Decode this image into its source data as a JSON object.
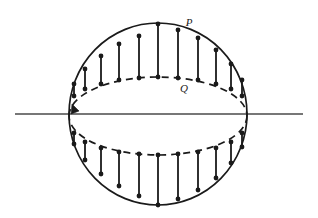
{
  "figure": {
    "type": "geometric-diagram",
    "background_color": "#ffffff",
    "ink_color": "#1a1a1a",
    "canvas": {
      "width": 318,
      "height": 218
    },
    "top_artifact_text": "",
    "labels": [
      {
        "name": "point-p-label",
        "text": "P",
        "x": 189,
        "y": 26
      },
      {
        "name": "point-q-label",
        "text": "Q",
        "x": 184,
        "y": 92
      }
    ],
    "axis_line": {
      "name": "horizontal-axis",
      "x1": 15,
      "y1": 114,
      "x2": 303,
      "y2": 114,
      "stroke_width": 1.6,
      "color": "#4a4a4a"
    },
    "circle": {
      "name": "sphere-outline",
      "cx": 158,
      "cy": 114,
      "rx": 89,
      "ry": 91,
      "stroke_width": 1.7
    },
    "ellipse": {
      "name": "equator-ellipse",
      "cx": 158,
      "cy": 116,
      "rx": 89,
      "ry": 39,
      "stroke_width": 1.7,
      "dash_pattern": "7 5",
      "front_is_dashed": false,
      "back_is_dashed": true,
      "direction_arrow": {
        "name": "direction-arrow",
        "at_x": 72,
        "at_y": 104,
        "angle_deg": 250
      }
    },
    "chords": {
      "name": "pq-chord-set",
      "stroke_width": 1.8,
      "dot_radius": 2.4,
      "upper_count": 11,
      "lower_count": 11,
      "angles_deg": [
        14,
        32,
        50,
        68,
        86,
        104,
        122,
        140,
        158,
        176,
        194
      ]
    },
    "chart_data": {
      "type": "scatter",
      "title": "",
      "xlabel": "",
      "ylabel": "",
      "note": "Each vertical segment joins a point P on the sphere profile circle to the corresponding point Q on the equatorial ellipse directly below (or above) it.",
      "upper_segments": [
        {
          "x": 74,
          "p_y": 84,
          "q_y": 96
        },
        {
          "x": 85,
          "p_y": 69,
          "q_y": 89
        },
        {
          "x": 101,
          "p_y": 56,
          "q_y": 84
        },
        {
          "x": 119,
          "p_y": 44,
          "q_y": 80
        },
        {
          "x": 139,
          "p_y": 36,
          "q_y": 78
        },
        {
          "x": 158,
          "p_y": 24,
          "q_y": 77
        },
        {
          "x": 178,
          "p_y": 30,
          "q_y": 78
        },
        {
          "x": 198,
          "p_y": 38,
          "q_y": 80
        },
        {
          "x": 216,
          "p_y": 50,
          "q_y": 84
        },
        {
          "x": 231,
          "p_y": 64,
          "q_y": 89
        },
        {
          "x": 242,
          "p_y": 80,
          "q_y": 96
        }
      ],
      "lower_segments": [
        {
          "x": 74,
          "p_y": 144,
          "q_y": 133
        },
        {
          "x": 85,
          "p_y": 160,
          "q_y": 142
        },
        {
          "x": 101,
          "p_y": 174,
          "q_y": 148
        },
        {
          "x": 119,
          "p_y": 186,
          "q_y": 152
        },
        {
          "x": 139,
          "p_y": 196,
          "q_y": 154
        },
        {
          "x": 158,
          "p_y": 205,
          "q_y": 155
        },
        {
          "x": 178,
          "p_y": 199,
          "q_y": 154
        },
        {
          "x": 198,
          "p_y": 190,
          "q_y": 152
        },
        {
          "x": 216,
          "p_y": 178,
          "q_y": 148
        },
        {
          "x": 231,
          "p_y": 163,
          "q_y": 142
        },
        {
          "x": 242,
          "p_y": 147,
          "q_y": 133
        }
      ]
    }
  }
}
